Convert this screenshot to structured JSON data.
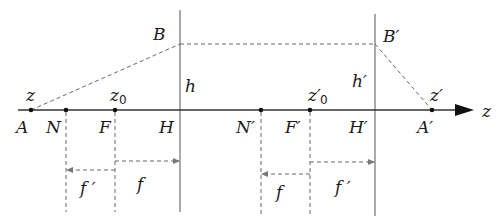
{
  "diagram": {
    "type": "optical-system-cardinal-points",
    "axis_label": "z",
    "points": {
      "A": {
        "label": "A",
        "x": 31
      },
      "N": {
        "label": "N",
        "x": 66
      },
      "F": {
        "label": "F",
        "x": 115
      },
      "H": {
        "label": "H",
        "x": 180
      },
      "N_prime": {
        "label": "N′",
        "x": 261
      },
      "F_prime": {
        "label": "F′",
        "x": 310
      },
      "H_prime": {
        "label": "H′",
        "x": 375
      },
      "A_prime": {
        "label": "A′",
        "x": 432
      }
    },
    "upper_labels": {
      "z": "z",
      "z0": "z",
      "z0_sub": "0",
      "z0_prime": "z′",
      "z0_prime_sub": "0",
      "z_prime": "z′",
      "B": "B",
      "B_prime": "B′",
      "h": "h",
      "h_prime": "h′"
    },
    "distance_labels": {
      "left_f_prime": "f ′",
      "left_f": "f",
      "right_f": "f",
      "right_f_prime": "f ′"
    },
    "colors": {
      "line": "#333333",
      "dashed": "#666666",
      "text": "#1a1a1a",
      "background": "#ffffff"
    }
  }
}
